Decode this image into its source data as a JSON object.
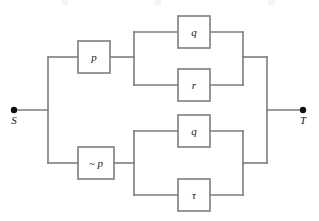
{
  "figure": {
    "name": "series-parallel-network",
    "width": 319,
    "height": 221,
    "background_color": "#ffffff",
    "line_color": "#7d7d7d",
    "box_fill_color": "#ffffff",
    "label_color": "#1a1a1a",
    "terminal_dot_color": "#111111"
  },
  "terminals": {
    "source": {
      "label": "S",
      "x": 14,
      "y": 110,
      "label_x": 14,
      "label_y": 124
    },
    "sink": {
      "label": "T",
      "x": 303,
      "y": 110,
      "label_x": 303,
      "label_y": 124
    }
  },
  "blocks": [
    {
      "id": "p",
      "label": "p",
      "branch": "upper",
      "role": "gate",
      "x": 78,
      "y": 41,
      "w": 32,
      "h": 32,
      "cx": 94,
      "cy": 57
    },
    {
      "id": "q-upper",
      "label": "q",
      "branch": "upper",
      "role": "parallel-top",
      "x": 178,
      "y": 16,
      "w": 32,
      "h": 32,
      "cx": 194,
      "cy": 32
    },
    {
      "id": "r-upper",
      "label": "r",
      "branch": "upper",
      "role": "parallel-bottom",
      "x": 178,
      "y": 69,
      "w": 32,
      "h": 32,
      "cx": 194,
      "cy": 85
    },
    {
      "id": "not-p",
      "label": "~ p",
      "branch": "lower",
      "role": "gate",
      "x": 78,
      "y": 147,
      "w": 36,
      "h": 32,
      "cx": 96,
      "cy": 163
    },
    {
      "id": "q-lower",
      "label": "q",
      "branch": "lower",
      "role": "parallel-top",
      "x": 178,
      "y": 115,
      "w": 32,
      "h": 32,
      "cx": 194,
      "cy": 131
    },
    {
      "id": "tau-lower",
      "label": "τ",
      "branch": "lower",
      "role": "parallel-bottom",
      "x": 178,
      "y": 179,
      "w": 32,
      "h": 32,
      "cx": 194,
      "cy": 195
    }
  ],
  "wires": {
    "source_lead": "M14,110 H48",
    "left_bus": "M48,57 V163",
    "upper_gate_in": "M48,57 H78",
    "upper_gate_out": "M110,57 H134",
    "upper_split_bus": "M134,32 V85",
    "upper_q_in": "M134,32 H178",
    "upper_r_in": "M134,85 H178",
    "upper_q_out": "M210,32 H243",
    "upper_r_out": "M210,85 H243",
    "upper_merge_bus": "M243,32 V85",
    "upper_merge_out": "M243,57 H267",
    "lower_gate_in": "M48,163 H78",
    "lower_gate_out": "M114,163 H134",
    "lower_split_bus": "M134,131 V195",
    "lower_q_in": "M134,131 H178",
    "lower_tau_in": "M134,195 H178",
    "lower_q_out": "M210,131 H243",
    "lower_tau_out": "M210,195 H243",
    "lower_merge_bus": "M243,131 V195",
    "lower_merge_out": "M243,163 H267",
    "right_bus": "M267,57 V163",
    "sink_lead": "M267,110 H303"
  }
}
